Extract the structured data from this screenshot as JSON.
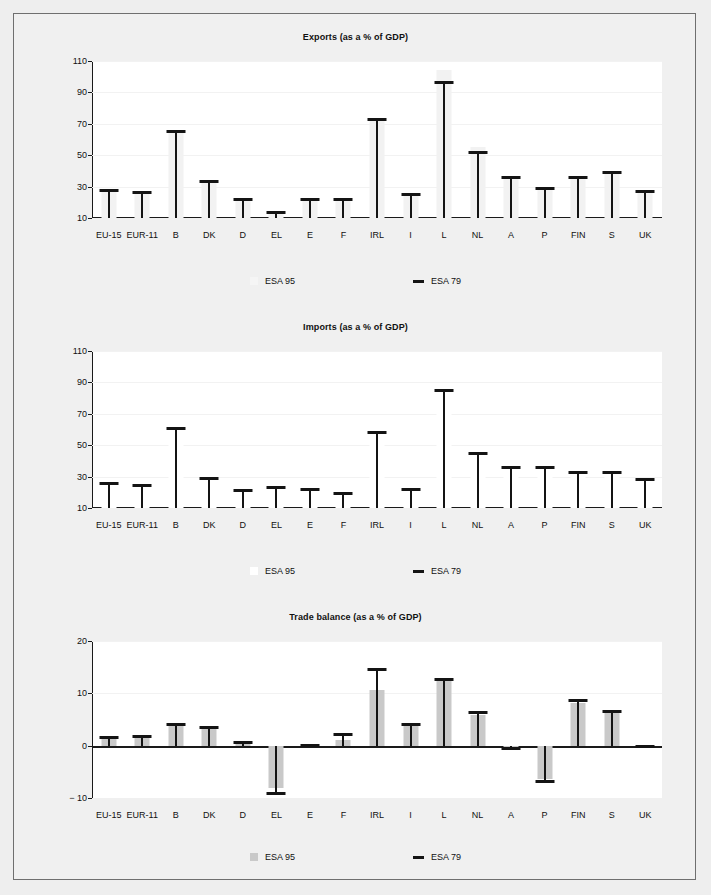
{
  "figure": {
    "background": "#eeeeee",
    "panel_background": "#f0f0f0",
    "plot_background": "#ffffff",
    "border_color": "#6f6f6f"
  },
  "legend": {
    "esa95_label": "ESA 95",
    "esa79_label": "ESA 79",
    "esa95_color": "#c9c9c9",
    "esa79_color": "#141414"
  },
  "categories": [
    "EU-15",
    "EUR-11",
    "B",
    "DK",
    "D",
    "EL",
    "E",
    "F",
    "IRL",
    "I",
    "L",
    "NL",
    "A",
    "P",
    "FIN",
    "S",
    "UK"
  ],
  "chart_data": [
    {
      "type": "bar",
      "id": "exports",
      "title": "Exports (as a % of GDP)",
      "xlabel": "",
      "ylabel": "",
      "ylim": [
        10,
        110
      ],
      "yticks": [
        10,
        30,
        50,
        70,
        90,
        110
      ],
      "grid": true,
      "baseline": 10,
      "categories": [
        "EU-15",
        "EUR-11",
        "B",
        "DK",
        "D",
        "EL",
        "E",
        "F",
        "IRL",
        "I",
        "L",
        "NL",
        "A",
        "P",
        "FIN",
        "S",
        "UK"
      ],
      "series": [
        {
          "name": "ESA 95",
          "style": "bar",
          "color": "#f2f2f2",
          "values": [
            28.5,
            27.0,
            66.0,
            34.5,
            22.5,
            14.5,
            22.5,
            22.5,
            73.5,
            26.0,
            104.0,
            55.5,
            37.0,
            29.5,
            37.0,
            40.0,
            28.0
          ]
        },
        {
          "name": "ESA 79",
          "style": "tick",
          "color": "#141414",
          "values": [
            28.5,
            27.0,
            66.0,
            34.5,
            22.5,
            14.5,
            22.5,
            22.5,
            73.5,
            26.0,
            97.0,
            52.5,
            37.0,
            29.5,
            37.0,
            40.0,
            28.0
          ]
        }
      ]
    },
    {
      "type": "bar",
      "id": "imports",
      "title": "Imports (as a % of GDP)",
      "xlabel": "",
      "ylabel": "",
      "ylim": [
        10,
        110
      ],
      "yticks": [
        10,
        30,
        50,
        70,
        90,
        110
      ],
      "grid": true,
      "baseline": 10,
      "categories": [
        "EU-15",
        "EUR-11",
        "B",
        "DK",
        "D",
        "EL",
        "E",
        "F",
        "IRL",
        "I",
        "L",
        "NL",
        "A",
        "P",
        "FIN",
        "S",
        "UK"
      ],
      "series": [
        {
          "name": "ESA 95",
          "style": "bar",
          "color": "#ffffff",
          "values": [
            26.5,
            25.5,
            61.5,
            30.0,
            22.0,
            24.0,
            22.5,
            20.5,
            59.0,
            23.0,
            85.5,
            45.5,
            37.0,
            36.5,
            33.5,
            33.5,
            29.0
          ]
        },
        {
          "name": "ESA 79",
          "style": "tick",
          "color": "#141414",
          "values": [
            26.5,
            25.5,
            61.5,
            30.0,
            22.0,
            24.0,
            22.5,
            20.5,
            59.0,
            23.0,
            85.5,
            45.5,
            37.0,
            36.5,
            33.5,
            33.5,
            29.0
          ]
        }
      ]
    },
    {
      "type": "bar",
      "id": "trade-balance",
      "title": "Trade balance (as a % of GDP)",
      "xlabel": "",
      "ylabel": "",
      "ylim": [
        -10,
        20
      ],
      "yticks": [
        -10,
        0,
        10,
        20
      ],
      "ytick_labels": [
        "− 10",
        "0",
        "10",
        "20"
      ],
      "grid": true,
      "baseline": 0,
      "categories": [
        "EU-15",
        "EUR-11",
        "B",
        "DK",
        "D",
        "EL",
        "E",
        "F",
        "IRL",
        "I",
        "L",
        "NL",
        "A",
        "P",
        "FIN",
        "S",
        "UK"
      ],
      "series": [
        {
          "name": "ESA 95",
          "style": "bar",
          "color": "#c9c9c9",
          "values": [
            1.2,
            1.4,
            3.7,
            3.8,
            0.7,
            -8.0,
            -0.2,
            1.1,
            10.6,
            4.0,
            12.9,
            5.9,
            -0.9,
            -6.4,
            8.1,
            6.6,
            -0.4
          ]
        },
        {
          "name": "ESA 79",
          "style": "tick",
          "color": "#141414",
          "values": [
            1.8,
            2.1,
            4.4,
            3.8,
            0.8,
            -9.4,
            -0.3,
            2.4,
            14.8,
            4.3,
            13.0,
            6.7,
            -0.9,
            -7.2,
            8.9,
            6.8,
            -0.4
          ]
        }
      ]
    }
  ]
}
